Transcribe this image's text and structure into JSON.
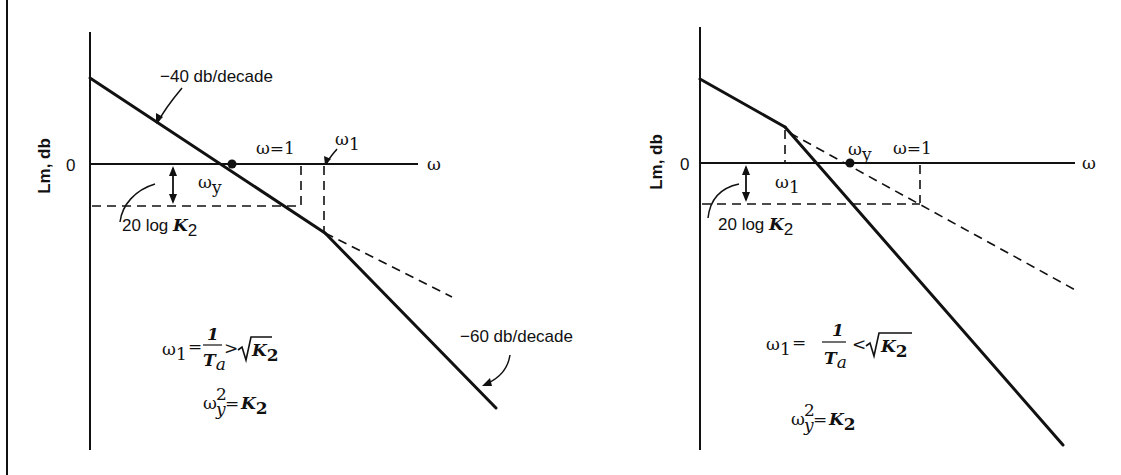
{
  "figure": {
    "border_color": "#111111",
    "background": "#ffffff"
  },
  "left_panel": {
    "y_axis_label": "Lm, db",
    "zero_tick": "0",
    "x_axis_label": "ω",
    "slope1_label": "−40 db/decade",
    "slope2_label": "−60 db/decade",
    "omega_eq_1_label": "ω=1",
    "omega1_label": "ω",
    "omega1_sub": "1",
    "omegay_label": "ω",
    "omegay_sub": "y",
    "gain_label_text": "20 log ",
    "gain_label_var": "K",
    "gain_label_sub": "2",
    "condition": {
      "lhs": "ω",
      "lhs_sub": "1",
      "eq": "=",
      "num": "1",
      "den": "T",
      "den_sub": "a",
      "rel": ">",
      "sqrt_var": "K",
      "sqrt_sub": "2"
    },
    "relation": {
      "lhs": "ω",
      "lhs_sup": "2",
      "lhs_sub": "y",
      "eq": "=",
      "rhs": "K",
      "rhs_sub": "2"
    }
  },
  "right_panel": {
    "y_axis_label": "Lm, db",
    "zero_tick": "0",
    "x_axis_label": "ω",
    "omega_eq_1_label": "ω=1",
    "omega1_label": "ω",
    "omega1_sub": "1",
    "omegay_label": "ω",
    "omegay_sub": "y",
    "gain_label_text": "20 log ",
    "gain_label_var": "K",
    "gain_label_sub": "2",
    "condition": {
      "lhs": "ω",
      "lhs_sub": "1",
      "eq": "=",
      "num": "1",
      "den": "T",
      "den_sub": "a",
      "rel": "<",
      "sqrt_var": "K",
      "sqrt_sub": "2"
    },
    "relation": {
      "lhs": "ω",
      "lhs_sup": "2",
      "lhs_sub": "y",
      "eq": "=",
      "rhs": "K",
      "rhs_sub": "2"
    }
  }
}
